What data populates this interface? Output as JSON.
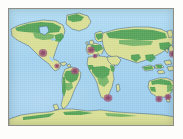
{
  "figure": {
    "kind": "world-map",
    "projection": "rectangular",
    "border_color": "#8e8d86"
  },
  "legend_colors": {
    "ocean": "#a9d6f0",
    "land": "#d9de97",
    "vegetation": "#4f9e59",
    "coastline": "#2f4f77",
    "marker": "#9e5c79",
    "page_background": "#fdfdfb"
  },
  "markers": [
    {
      "id": "m1",
      "label": "North America West Coast",
      "x": 34,
      "y": 44,
      "rx": 4.2,
      "ry": 4.0
    },
    {
      "id": "m2",
      "label": "Central America",
      "x": 48,
      "y": 57,
      "rx": 2.6,
      "ry": 2.4
    },
    {
      "id": "m3",
      "label": "Northern South America",
      "x": 66,
      "y": 62,
      "rx": 4.0,
      "ry": 3.6
    },
    {
      "id": "m4",
      "label": "Western Europe",
      "x": 82,
      "y": 41,
      "rx": 3.8,
      "ry": 3.4
    },
    {
      "id": "m5",
      "label": "Mediterranean",
      "x": 86,
      "y": 47,
      "rx": 2.4,
      "ry": 2.2
    },
    {
      "id": "m6",
      "label": "Southern Africa",
      "x": 99,
      "y": 89,
      "rx": 4.4,
      "ry": 3.8
    },
    {
      "id": "m7",
      "label": "East Asia / Japan",
      "x": 164,
      "y": 45,
      "rx": 4.0,
      "ry": 3.6
    },
    {
      "id": "m8",
      "label": "Southwest Australia",
      "x": 150,
      "y": 90,
      "rx": 3.6,
      "ry": 3.2
    },
    {
      "id": "m9",
      "label": "Southeast Australia",
      "x": 159,
      "y": 88,
      "rx": 3.4,
      "ry": 3.0
    }
  ],
  "regions": [
    {
      "id": "north-america",
      "label": "North America"
    },
    {
      "id": "south-america",
      "label": "South America"
    },
    {
      "id": "europe",
      "label": "Europe"
    },
    {
      "id": "africa",
      "label": "Africa"
    },
    {
      "id": "asia",
      "label": "Asia"
    },
    {
      "id": "australia",
      "label": "Australia"
    },
    {
      "id": "antarctica",
      "label": "Antarctica"
    },
    {
      "id": "greenland",
      "label": "Greenland"
    }
  ]
}
